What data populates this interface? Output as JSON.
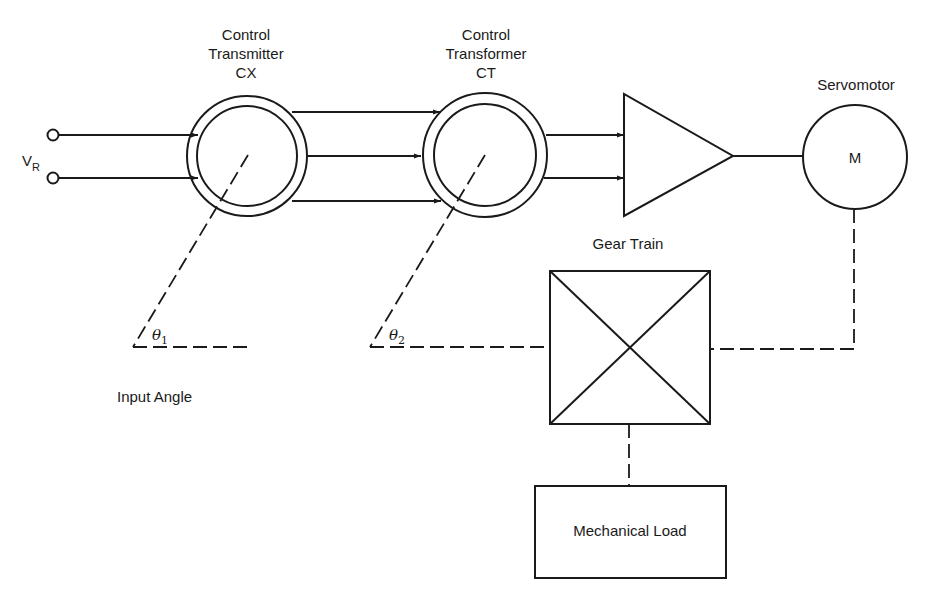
{
  "diagram": {
    "type": "servo control system block diagram",
    "input": {
      "label": "V",
      "subscript": "R"
    },
    "control_transmitter": {
      "line1": "Control",
      "line2": "Transmitter",
      "line3": "CX"
    },
    "control_transformer": {
      "line1": "Control",
      "line2": "Transformer",
      "line3": "CT"
    },
    "servomotor": {
      "title": "Servomotor",
      "symbol": "M"
    },
    "gear_train": {
      "title": "Gear Train"
    },
    "mechanical_load": {
      "label": "Mechanical Load"
    },
    "angles": {
      "theta1": {
        "symbol": "θ",
        "subscript": "1"
      },
      "theta2": {
        "symbol": "θ",
        "subscript": "2"
      }
    },
    "input_angle_label": "Input Angle",
    "colors": {
      "line": "#1a1a1a",
      "background": "#ffffff"
    }
  }
}
